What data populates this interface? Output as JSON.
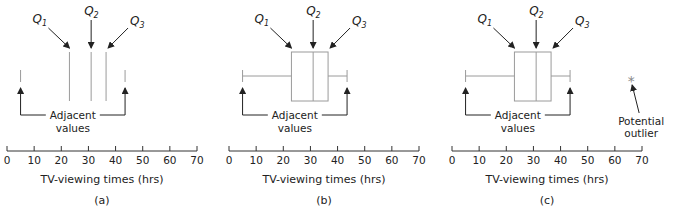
{
  "panels": [
    {
      "id": "a",
      "caption": "(a)",
      "x0": 7,
      "show_box": false,
      "show_outlier": false
    },
    {
      "id": "b",
      "caption": "(b)",
      "x0": 229,
      "show_box": true,
      "show_outlier": false
    },
    {
      "id": "c",
      "caption": "(c)",
      "x0": 452,
      "show_box": true,
      "show_outlier": true
    }
  ],
  "labels": {
    "q1": "Q",
    "q1_sub": "1",
    "q2": "Q",
    "q2_sub": "2",
    "q3": "Q",
    "q3_sub": "3",
    "adjacent_line1": "Adjacent",
    "adjacent_line2": "values",
    "outlier_line1": "Potential",
    "outlier_line2": "outlier",
    "outlier_marker": "*",
    "axis_title": "TV-viewing times (hrs)"
  },
  "colors": {
    "box_stroke": "#9a9a9a",
    "axis": "#333333",
    "arrow": "#222222",
    "outlier": "#888888"
  },
  "chart_data": {
    "type": "boxplot",
    "title": "",
    "xlabel": "TV-viewing times (hrs)",
    "ylabel": "",
    "xlim": [
      0,
      70
    ],
    "ticks": [
      0,
      10,
      20,
      30,
      40,
      50,
      60,
      70
    ],
    "summary": {
      "lower_adjacent": 5,
      "q1": 23,
      "q2": 31,
      "q3": 36.5,
      "upper_adjacent": 43.5,
      "potential_outlier": 66
    },
    "panels": [
      {
        "caption": "(a)",
        "elements": [
          "Q1",
          "Q2",
          "Q3",
          "Adjacent values"
        ]
      },
      {
        "caption": "(b)",
        "elements": [
          "Q1",
          "Q2",
          "Q3",
          "box",
          "whiskers",
          "Adjacent values"
        ]
      },
      {
        "caption": "(c)",
        "elements": [
          "Q1",
          "Q2",
          "Q3",
          "box",
          "whiskers",
          "Adjacent values",
          "Potential outlier"
        ]
      }
    ]
  }
}
